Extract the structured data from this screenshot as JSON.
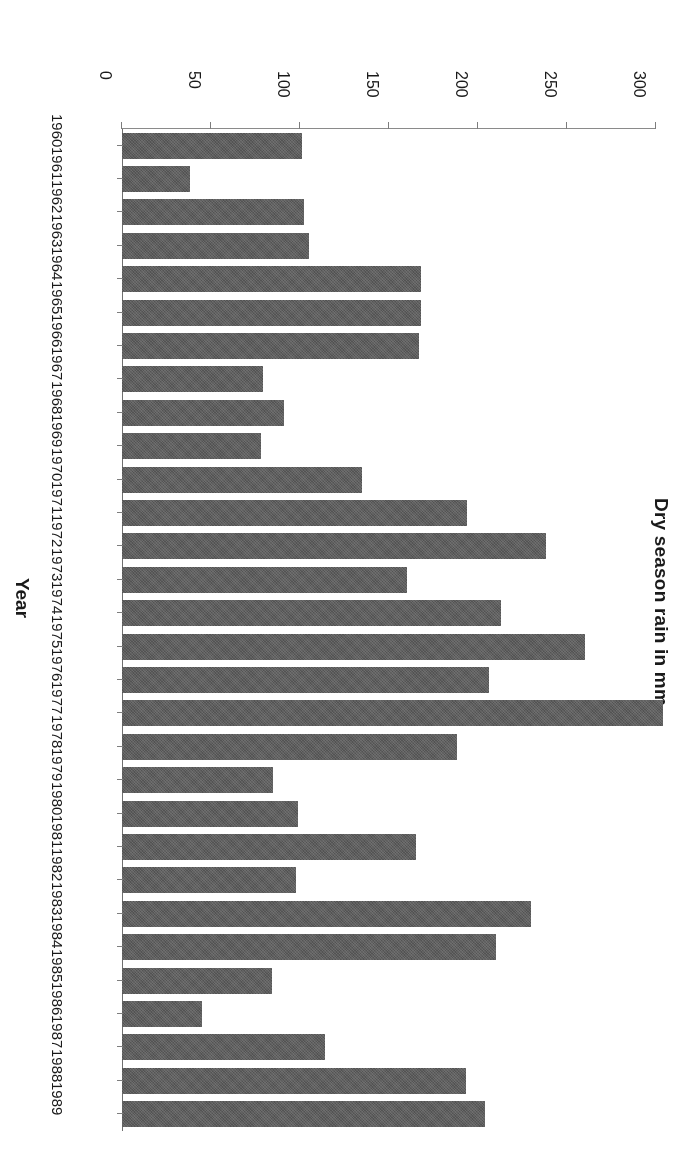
{
  "figure": {
    "orientation_note": "printed-upside-down",
    "background_color": "#ffffff",
    "bar_color": "#5e5e5e",
    "axis_color": "#7d7d7d"
  },
  "chart_data": {
    "type": "bar",
    "title": "",
    "subtitle": "",
    "orientation": "vertical",
    "xlabel": "Year",
    "ylabel": "Dry season rain in mm",
    "ylim": [
      0,
      300
    ],
    "yticks": [
      0,
      50,
      100,
      150,
      200,
      250,
      300
    ],
    "ytick_labels": [
      "0",
      "50",
      "100",
      "150",
      "200",
      "250",
      "300"
    ],
    "grid": false,
    "legend": null,
    "annotations": [],
    "categories": [
      "1960",
      "1961",
      "1962",
      "1963",
      "1964",
      "1965",
      "1966",
      "1967",
      "1968",
      "1969",
      "1970",
      "1971",
      "1972",
      "1973",
      "1974",
      "1975",
      "1976",
      "1977",
      "1978",
      "1979",
      "1980",
      "1981",
      "1982",
      "1983",
      "1984",
      "1985",
      "1986",
      "1987",
      "1988",
      "1989"
    ],
    "values": [
      101,
      38,
      102,
      105,
      168,
      168,
      167,
      79,
      91,
      78,
      135,
      194,
      238,
      160,
      213,
      260,
      206,
      304,
      188,
      85,
      99,
      165,
      98,
      230,
      210,
      84,
      45,
      114,
      193,
      204
    ]
  }
}
